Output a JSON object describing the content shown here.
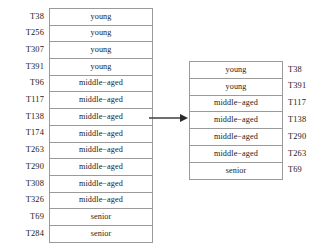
{
  "figure": {
    "left_table": {
      "name": "full-dataset-table",
      "rows": [
        {
          "id": "T38",
          "category": "young"
        },
        {
          "id": "T256",
          "category": "young"
        },
        {
          "id": "T307",
          "category": "young"
        },
        {
          "id": "T391",
          "category": "young"
        },
        {
          "id": "T96",
          "category": "middle−aged"
        },
        {
          "id": "T117",
          "category": "middle−aged"
        },
        {
          "id": "T138",
          "category": "middle−aged"
        },
        {
          "id": "T174",
          "category": "middle−aged"
        },
        {
          "id": "T263",
          "category": "middle−aged"
        },
        {
          "id": "T290",
          "category": "middle−aged"
        },
        {
          "id": "T308",
          "category": "middle−aged"
        },
        {
          "id": "T326",
          "category": "middle−aged"
        },
        {
          "id": "T69",
          "category": "senior"
        },
        {
          "id": "T284",
          "category": "senior"
        }
      ]
    },
    "right_table": {
      "name": "sampled-subset-table",
      "rows": [
        {
          "category": "young",
          "id": "T38"
        },
        {
          "category": "young",
          "id": "T391"
        },
        {
          "category": "middle−aged",
          "id": "T117"
        },
        {
          "category": "middle−aged",
          "id": "T138"
        },
        {
          "category": "middle−aged",
          "id": "T290"
        },
        {
          "category": "middle−aged",
          "id": "T263"
        },
        {
          "category": "senior",
          "id": "T69"
        }
      ]
    },
    "arrow": {
      "name": "transformation-arrow",
      "direction": "right"
    }
  }
}
